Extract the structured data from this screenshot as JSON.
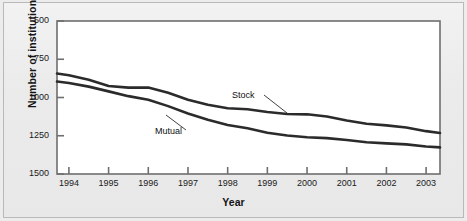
{
  "chart_data": {
    "type": "line",
    "title": "",
    "xlabel": "Year",
    "ylabel": "Number of institutions",
    "x": [
      1994,
      1995,
      1996,
      1997,
      1998,
      1999,
      2000,
      2001,
      2002,
      2003
    ],
    "xlim": [
      1993.7,
      2003.35
    ],
    "ylim": [
      500,
      1500
    ],
    "yticks": [
      500,
      750,
      1000,
      1250,
      1500
    ],
    "xticks": [
      1994,
      1995,
      1996,
      1997,
      1998,
      1999,
      2000,
      2001,
      2002,
      2003
    ],
    "grid": false,
    "legend": "inline-annotations",
    "series": [
      {
        "name": "Stock",
        "values": [
          1145,
          1075,
          1065,
          985,
          930,
          905,
          890,
          850,
          818,
          780
        ],
        "color": "#2b2b2b"
      },
      {
        "name": "Mutual",
        "values": [
          1095,
          1040,
          985,
          895,
          820,
          770,
          740,
          722,
          700,
          680
        ],
        "color": "#2b2b2b"
      }
    ],
    "annotations": [
      {
        "text": "Stock",
        "series": "Stock"
      },
      {
        "text": "Mutual",
        "series": "Mutual"
      }
    ]
  },
  "axes": {
    "y_title": "Number of institutions",
    "x_title": "Year",
    "y_tick_labels": [
      "1500",
      "1250",
      "1000",
      "750",
      "500"
    ],
    "x_tick_labels": [
      "1994",
      "1995",
      "1996",
      "1997",
      "1998",
      "1999",
      "2000",
      "2001",
      "2002",
      "2003"
    ]
  },
  "labels": {
    "stock": "Stock",
    "mutual": "Mutual"
  },
  "colors": {
    "line": "#2b2b2b",
    "frame": "#6f6f70",
    "page_background": "#ececed",
    "plot_background": "#ffffff",
    "text": "#141414"
  }
}
